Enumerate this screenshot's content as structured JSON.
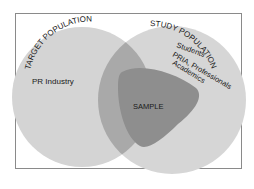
{
  "diagram": {
    "type": "venn",
    "sets": [
      {
        "id": "target",
        "label": "TARGET POPULATION",
        "members": [
          "PR Industry"
        ]
      },
      {
        "id": "study",
        "label": "STUDY POPULATION",
        "members": [
          "Students",
          "PRIA, Professionals",
          "Academics"
        ]
      },
      {
        "id": "sample",
        "label": "SAMPLE"
      }
    ],
    "labels": {
      "target_population": "TARGET POPULATION",
      "pr_industry": "PR Industry",
      "study_population": "STUDY POPULATION",
      "students": "Students",
      "pria_professionals": "PRIA, Professionals",
      "academics": "Academics",
      "sample": "SAMPLE"
    },
    "colors": {
      "frame": "#8a8a8a",
      "target_fill": "#d4d4d4",
      "study_fill": "#d6d6d6",
      "overlap_fill": "#a9a9a9",
      "sample_fill": "#8e8e8e",
      "text": "#1a1a1a"
    }
  }
}
